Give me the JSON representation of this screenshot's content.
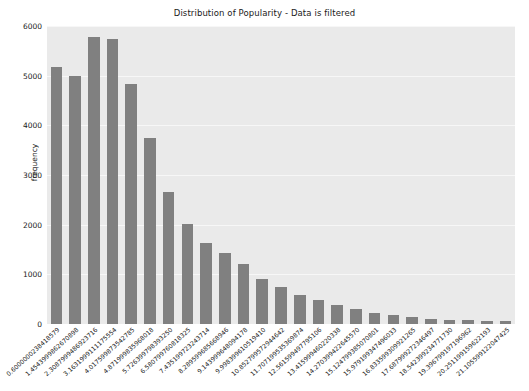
{
  "chart_data": {
    "type": "bar",
    "title": "Distribution of Popularity - Data is filtered",
    "xlabel": "",
    "ylabel": "frequency",
    "ylim": [
      0,
      6000
    ],
    "yticks": [
      0,
      1000,
      2000,
      3000,
      4000,
      5000,
      6000
    ],
    "ytick_labels": [
      "0",
      "1000",
      "2000",
      "3000",
      "4000",
      "5000",
      "6000"
    ],
    "grid": true,
    "legend": null,
    "bar_color": "#808080",
    "plot_background": "#eaeaea",
    "figure_background": "#ffffff",
    "categories": [
      "0.6000000238418579",
      "1.4543999862670898",
      "2.3087999486923716",
      "3.1631999111175554",
      "4.017599873542785",
      "4.871999835968018",
      "5.726399798393250",
      "6.580799760818325",
      "7.435199723243714",
      "8.289599685668946",
      "9.143999648094178",
      "9.998399610519410",
      "10.852799572944642",
      "11.707199535369874",
      "12.561599497795106",
      "13.415999460220338",
      "14.270399422645570",
      "15.124799385070801",
      "15.979199347496033",
      "16.833599309921265",
      "17.687999272346497",
      "18.542399234771730",
      "19.396799197196962",
      "20.251199159622193",
      "21.105599122047425"
    ],
    "values": [
      5180,
      5000,
      5780,
      5730,
      4830,
      3740,
      2650,
      2010,
      1630,
      1430,
      1200,
      900,
      740,
      590,
      480,
      390,
      300,
      230,
      180,
      140,
      110,
      90,
      80,
      70,
      60
    ]
  }
}
